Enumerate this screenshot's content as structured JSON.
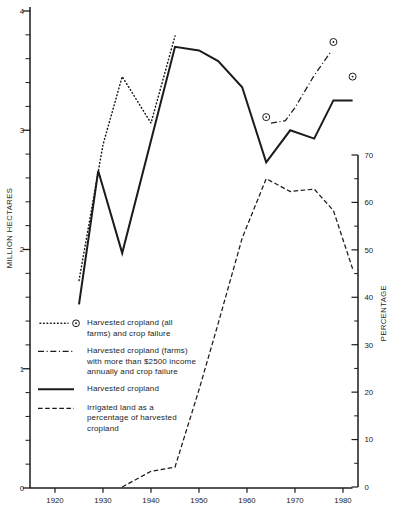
{
  "figure": {
    "background": "#ffffff",
    "ink": "#1b1b1b"
  },
  "chart_data": {
    "type": "line",
    "title": "",
    "x_axis": {
      "label": "",
      "ticks": [
        1920,
        1930,
        1940,
        1950,
        1960,
        1970,
        1980
      ],
      "range": [
        1914.8,
        1982.5
      ]
    },
    "y_left": {
      "label": "MILLION HECTARES",
      "ticks": [
        0,
        1,
        2,
        3,
        4
      ],
      "range": [
        0,
        4.03
      ],
      "minor_step": 0.2
    },
    "y_right": {
      "label": "PERCENTAGE",
      "ticks": [
        0,
        10,
        20,
        30,
        40,
        50,
        60,
        70
      ],
      "range": [
        0,
        70
      ],
      "minor_step": 5
    },
    "grid": "off",
    "legend_position": "inside-left",
    "series": [
      {
        "name": "Harvested cropland (all farms) and crop failure",
        "axis": "left",
        "style": "dotted",
        "marker": "circled-dot",
        "line_points": [
          [
            1925,
            1.74
          ],
          [
            1930,
            2.88
          ],
          [
            1934,
            3.45
          ],
          [
            1940,
            3.06
          ],
          [
            1945,
            3.79
          ]
        ],
        "marker_points": [
          [
            1964,
            3.11
          ],
          [
            1978,
            3.74
          ],
          [
            1982,
            3.45
          ]
        ]
      },
      {
        "name": "Harvested cropland (farms) with more than $2500 income annually and crop failure",
        "axis": "left",
        "style": "dashdot",
        "marker": "none",
        "line_points": [
          [
            1965,
            3.06
          ],
          [
            1968,
            3.08
          ],
          [
            1970,
            3.19
          ],
          [
            1974,
            3.46
          ],
          [
            1977.5,
            3.66
          ]
        ],
        "marker_points": []
      },
      {
        "name": "Harvested cropland",
        "axis": "left",
        "style": "solid",
        "marker": "none",
        "line_points": [
          [
            1925,
            1.54
          ],
          [
            1929,
            2.66
          ],
          [
            1934,
            1.97
          ],
          [
            1945,
            3.7
          ],
          [
            1950,
            3.67
          ],
          [
            1954,
            3.58
          ],
          [
            1959,
            3.36
          ],
          [
            1964,
            2.73
          ],
          [
            1969,
            3.0
          ],
          [
            1974,
            2.93
          ],
          [
            1978,
            3.25
          ],
          [
            1982,
            3.25
          ]
        ],
        "marker_points": []
      },
      {
        "name": "Irrigated land as a percentage of harvested cropland",
        "axis": "right",
        "style": "dashed",
        "marker": "none",
        "line_points": [
          [
            1934,
            0
          ],
          [
            1940,
            3.3
          ],
          [
            1945,
            4.2
          ],
          [
            1950,
            20.5
          ],
          [
            1954,
            34.5
          ],
          [
            1959,
            52.5
          ],
          [
            1964,
            65
          ],
          [
            1969,
            62.3
          ],
          [
            1974,
            62.8
          ],
          [
            1978,
            58.3
          ],
          [
            1982,
            46
          ]
        ],
        "marker_points": []
      }
    ]
  },
  "legend": {
    "items": [
      {
        "style": "dotted-with-circled-dot",
        "lines": [
          "Harvested cropland (all",
          "farms) and crop failure"
        ]
      },
      {
        "style": "dashdot",
        "lines": [
          "Harvested cropland (farms)",
          "with more than $2500 income",
          "annually and crop failure"
        ]
      },
      {
        "style": "solid",
        "lines": [
          "Harvested cropland"
        ]
      },
      {
        "style": "dashed",
        "lines": [
          "Irrigated land as a",
          "percentage of harvested",
          "cropland"
        ]
      }
    ]
  }
}
